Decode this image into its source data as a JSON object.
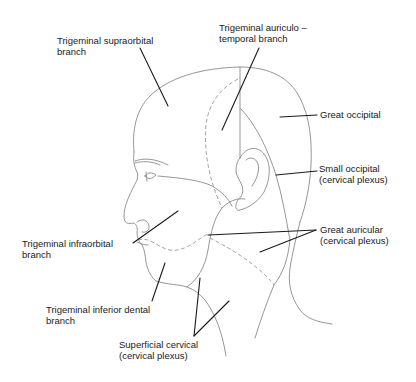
{
  "diagram": {
    "labels": {
      "supraorbital": {
        "line1": "Trigeminal supraorbital",
        "line2": "branch"
      },
      "auriculotemporal": {
        "line1": "Trigeminal auriculo –",
        "line2": "temporal branch"
      },
      "great_occipital": {
        "line1": "Great occipital"
      },
      "small_occipital": {
        "line1": "Small occipital",
        "line2": "(cervical plexus)"
      },
      "great_auricular": {
        "line1": "Great auricular",
        "line2": "(cervical plexus)"
      },
      "infraorbital": {
        "line1": "Trigeminal infraorbital",
        "line2": "branch"
      },
      "inferior_dental": {
        "line1": "Trigeminal inferior dental",
        "line2": "branch"
      },
      "superficial_cervical": {
        "line1": "Superficial cervical",
        "line2": "(cervical plexus)"
      }
    },
    "colors": {
      "outline": "#8a8a8a",
      "leader": "#1a1a1a",
      "text": "#1a1a1a",
      "background": "#ffffff"
    }
  }
}
